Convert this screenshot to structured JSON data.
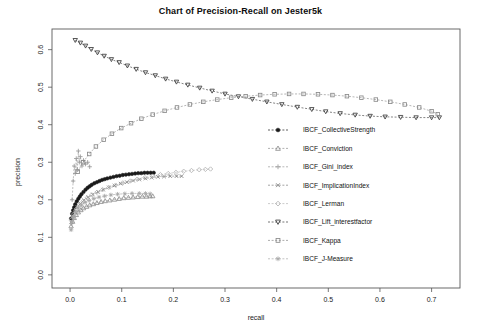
{
  "chart_data": {
    "type": "scatter",
    "title": "Chart of Precision-Recall on Jester5k",
    "xlabel": "recall",
    "ylabel": "precision",
    "xlim": [
      -0.035,
      0.755
    ],
    "ylim": [
      -0.035,
      0.655
    ],
    "xticks": [
      "0.0",
      "0.1",
      "0.2",
      "0.3",
      "0.4",
      "0.5",
      "0.6",
      "0.7"
    ],
    "xtick_values": [
      0.0,
      0.1,
      0.2,
      0.3,
      0.4,
      0.5,
      0.6,
      0.7
    ],
    "yticks": [
      "0.0",
      "0.1",
      "0.2",
      "0.3",
      "0.4",
      "0.5",
      "0.6"
    ],
    "ytick_values": [
      0.0,
      0.1,
      0.2,
      0.3,
      0.4,
      0.5,
      0.6
    ],
    "grid": false,
    "legend_position": "right-middle",
    "series": [
      {
        "name": "IBCF_CollectiveStrength",
        "marker": "circle-filled",
        "color": "#1a1a1a",
        "points": [
          [
            0.002,
            0.15
          ],
          [
            0.004,
            0.163
          ],
          [
            0.006,
            0.172
          ],
          [
            0.008,
            0.18
          ],
          [
            0.01,
            0.188
          ],
          [
            0.013,
            0.196
          ],
          [
            0.016,
            0.203
          ],
          [
            0.019,
            0.209
          ],
          [
            0.022,
            0.215
          ],
          [
            0.026,
            0.221
          ],
          [
            0.03,
            0.227
          ],
          [
            0.034,
            0.232
          ],
          [
            0.038,
            0.236
          ],
          [
            0.042,
            0.24
          ],
          [
            0.047,
            0.244
          ],
          [
            0.052,
            0.247
          ],
          [
            0.057,
            0.25
          ],
          [
            0.062,
            0.253
          ],
          [
            0.067,
            0.255
          ],
          [
            0.072,
            0.257
          ],
          [
            0.078,
            0.259
          ],
          [
            0.084,
            0.261
          ],
          [
            0.09,
            0.263
          ],
          [
            0.096,
            0.264
          ],
          [
            0.102,
            0.266
          ],
          [
            0.108,
            0.267
          ],
          [
            0.114,
            0.268
          ],
          [
            0.12,
            0.269
          ],
          [
            0.126,
            0.27
          ],
          [
            0.132,
            0.271
          ],
          [
            0.138,
            0.271
          ],
          [
            0.144,
            0.272
          ],
          [
            0.15,
            0.272
          ],
          [
            0.156,
            0.272
          ],
          [
            0.162,
            0.272
          ]
        ]
      },
      {
        "name": "IBCF_Conviction",
        "marker": "triangle-up",
        "color": "#8f8f8f",
        "points": [
          [
            0.002,
            0.13
          ],
          [
            0.005,
            0.142
          ],
          [
            0.008,
            0.152
          ],
          [
            0.012,
            0.16
          ],
          [
            0.016,
            0.167
          ],
          [
            0.021,
            0.173
          ],
          [
            0.026,
            0.178
          ],
          [
            0.032,
            0.182
          ],
          [
            0.038,
            0.186
          ],
          [
            0.045,
            0.189
          ],
          [
            0.052,
            0.192
          ],
          [
            0.06,
            0.195
          ],
          [
            0.068,
            0.197
          ],
          [
            0.077,
            0.199
          ],
          [
            0.086,
            0.201
          ],
          [
            0.095,
            0.203
          ],
          [
            0.104,
            0.205
          ],
          [
            0.113,
            0.206
          ],
          [
            0.122,
            0.207
          ],
          [
            0.131,
            0.208
          ],
          [
            0.14,
            0.209
          ],
          [
            0.148,
            0.209
          ],
          [
            0.155,
            0.21
          ],
          [
            0.16,
            0.21
          ]
        ]
      },
      {
        "name": "IBCF_Gini_index",
        "marker": "plus",
        "color": "#9a9a9a",
        "points": [
          [
            0.004,
            0.2
          ],
          [
            0.006,
            0.25
          ],
          [
            0.008,
            0.29
          ],
          [
            0.01,
            0.27
          ],
          [
            0.012,
            0.31
          ],
          [
            0.014,
            0.28
          ],
          [
            0.016,
            0.33
          ],
          [
            0.018,
            0.3
          ],
          [
            0.02,
            0.315
          ],
          [
            0.023,
            0.29
          ],
          [
            0.026,
            0.305
          ],
          [
            0.03,
            0.295
          ],
          [
            0.034,
            0.3
          ],
          [
            0.038,
            0.288
          ]
        ]
      },
      {
        "name": "IBCF_ImplicationIndex",
        "marker": "x",
        "color": "#7d7d7d",
        "points": [
          [
            0.002,
            0.14
          ],
          [
            0.005,
            0.155
          ],
          [
            0.009,
            0.168
          ],
          [
            0.014,
            0.18
          ],
          [
            0.02,
            0.19
          ],
          [
            0.027,
            0.199
          ],
          [
            0.035,
            0.207
          ],
          [
            0.044,
            0.214
          ],
          [
            0.054,
            0.221
          ],
          [
            0.064,
            0.227
          ],
          [
            0.075,
            0.233
          ],
          [
            0.086,
            0.238
          ],
          [
            0.098,
            0.243
          ],
          [
            0.11,
            0.247
          ],
          [
            0.122,
            0.251
          ],
          [
            0.134,
            0.254
          ],
          [
            0.146,
            0.257
          ],
          [
            0.158,
            0.259
          ],
          [
            0.17,
            0.261
          ],
          [
            0.182,
            0.262
          ],
          [
            0.194,
            0.263
          ],
          [
            0.206,
            0.263
          ],
          [
            0.216,
            0.263
          ]
        ]
      },
      {
        "name": "IBCF_Lerman",
        "marker": "diamond",
        "color": "#b5b5b5",
        "points": [
          [
            0.003,
            0.148
          ],
          [
            0.007,
            0.162
          ],
          [
            0.012,
            0.175
          ],
          [
            0.018,
            0.186
          ],
          [
            0.025,
            0.196
          ],
          [
            0.033,
            0.205
          ],
          [
            0.042,
            0.213
          ],
          [
            0.052,
            0.22
          ],
          [
            0.063,
            0.227
          ],
          [
            0.075,
            0.233
          ],
          [
            0.088,
            0.239
          ],
          [
            0.102,
            0.245
          ],
          [
            0.116,
            0.25
          ],
          [
            0.13,
            0.255
          ],
          [
            0.145,
            0.259
          ],
          [
            0.16,
            0.263
          ],
          [
            0.175,
            0.267
          ],
          [
            0.19,
            0.27
          ],
          [
            0.205,
            0.273
          ],
          [
            0.22,
            0.276
          ],
          [
            0.235,
            0.278
          ],
          [
            0.25,
            0.28
          ],
          [
            0.262,
            0.281
          ],
          [
            0.272,
            0.282
          ]
        ]
      },
      {
        "name": "IBCF_Lift_interestfactor",
        "marker": "triangle-down",
        "color": "#3b3b3b",
        "points": [
          [
            0.01,
            0.625
          ],
          [
            0.02,
            0.618
          ],
          [
            0.03,
            0.61
          ],
          [
            0.041,
            0.601
          ],
          [
            0.053,
            0.592
          ],
          [
            0.066,
            0.583
          ],
          [
            0.08,
            0.574
          ],
          [
            0.095,
            0.566
          ],
          [
            0.111,
            0.557
          ],
          [
            0.128,
            0.548
          ],
          [
            0.146,
            0.539
          ],
          [
            0.165,
            0.531
          ],
          [
            0.185,
            0.522
          ],
          [
            0.206,
            0.514
          ],
          [
            0.228,
            0.506
          ],
          [
            0.251,
            0.498
          ],
          [
            0.275,
            0.49
          ],
          [
            0.3,
            0.482
          ],
          [
            0.326,
            0.475
          ],
          [
            0.353,
            0.468
          ],
          [
            0.381,
            0.461
          ],
          [
            0.41,
            0.454
          ],
          [
            0.44,
            0.447
          ],
          [
            0.468,
            0.441
          ],
          [
            0.495,
            0.435
          ],
          [
            0.523,
            0.43
          ],
          [
            0.552,
            0.426
          ],
          [
            0.581,
            0.423
          ],
          [
            0.61,
            0.421
          ],
          [
            0.64,
            0.42
          ],
          [
            0.67,
            0.419
          ],
          [
            0.7,
            0.419
          ],
          [
            0.715,
            0.419
          ]
        ]
      },
      {
        "name": "IBCF_Kappa",
        "marker": "square",
        "color": "#8a8a8a",
        "points": [
          [
            0.015,
            0.275
          ],
          [
            0.025,
            0.3
          ],
          [
            0.037,
            0.322
          ],
          [
            0.05,
            0.342
          ],
          [
            0.065,
            0.36
          ],
          [
            0.081,
            0.376
          ],
          [
            0.099,
            0.391
          ],
          [
            0.118,
            0.404
          ],
          [
            0.138,
            0.416
          ],
          [
            0.16,
            0.427
          ],
          [
            0.183,
            0.437
          ],
          [
            0.207,
            0.446
          ],
          [
            0.232,
            0.454
          ],
          [
            0.258,
            0.461
          ],
          [
            0.285,
            0.467
          ],
          [
            0.312,
            0.472
          ],
          [
            0.34,
            0.476
          ],
          [
            0.368,
            0.479
          ],
          [
            0.396,
            0.481
          ],
          [
            0.424,
            0.482
          ],
          [
            0.452,
            0.482
          ],
          [
            0.48,
            0.481
          ],
          [
            0.508,
            0.479
          ],
          [
            0.536,
            0.476
          ],
          [
            0.564,
            0.472
          ],
          [
            0.592,
            0.467
          ],
          [
            0.62,
            0.461
          ],
          [
            0.648,
            0.454
          ],
          [
            0.676,
            0.446
          ],
          [
            0.7,
            0.436
          ],
          [
            0.712,
            0.428
          ]
        ]
      },
      {
        "name": "IBCF_J-Measure",
        "marker": "star",
        "color": "#a8a8a8",
        "points": [
          [
            0.002,
            0.12
          ],
          [
            0.004,
            0.14
          ],
          [
            0.007,
            0.155
          ],
          [
            0.011,
            0.168
          ],
          [
            0.016,
            0.178
          ],
          [
            0.022,
            0.186
          ],
          [
            0.029,
            0.193
          ],
          [
            0.037,
            0.198
          ],
          [
            0.046,
            0.203
          ],
          [
            0.056,
            0.207
          ],
          [
            0.067,
            0.21
          ],
          [
            0.079,
            0.213
          ],
          [
            0.092,
            0.215
          ],
          [
            0.106,
            0.216
          ],
          [
            0.12,
            0.217
          ],
          [
            0.134,
            0.217
          ],
          [
            0.146,
            0.217
          ],
          [
            0.155,
            0.216
          ]
        ]
      }
    ],
    "legend": [
      {
        "label": "IBCF_CollectiveStrength",
        "marker": "circle-filled",
        "color": "#1a1a1a"
      },
      {
        "label": "IBCF_Conviction",
        "marker": "triangle-up",
        "color": "#8f8f8f"
      },
      {
        "label": "IBCF_Gini_index",
        "marker": "plus",
        "color": "#9a9a9a"
      },
      {
        "label": "IBCF_ImplicationIndex",
        "marker": "x",
        "color": "#7d7d7d"
      },
      {
        "label": "IBCF_Lerman",
        "marker": "diamond",
        "color": "#b5b5b5"
      },
      {
        "label": "IBCF_Lift_interestfactor",
        "marker": "triangle-down",
        "color": "#3b3b3b"
      },
      {
        "label": "IBCF_Kappa",
        "marker": "square",
        "color": "#8a8a8a"
      },
      {
        "label": "IBCF_J-Measure",
        "marker": "star",
        "color": "#a8a8a8"
      }
    ]
  }
}
